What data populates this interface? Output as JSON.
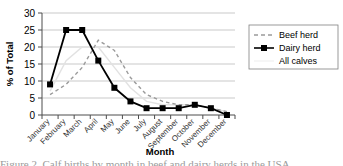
{
  "chart_data": {
    "type": "line",
    "title": "",
    "xlabel": "Month",
    "ylabel": "% of Total",
    "ylim": [
      0,
      30
    ],
    "yticks": [
      0,
      5,
      10,
      15,
      20,
      25,
      30
    ],
    "grid": true,
    "legend_position": "right",
    "categories": [
      "January",
      "February",
      "March",
      "April",
      "May",
      "June",
      "July",
      "August",
      "September",
      "October",
      "November",
      "December"
    ],
    "series": [
      {
        "name": "Beef herd",
        "style": "dashed",
        "color": "#9a9a9a",
        "marker": "none",
        "values": [
          6,
          9,
          14,
          22,
          19,
          11,
          6,
          4,
          3,
          3,
          2,
          1
        ]
      },
      {
        "name": "Dairy herd",
        "style": "solid",
        "color": "#000000",
        "marker": "square",
        "values": [
          9,
          25,
          25,
          16,
          8,
          4,
          2,
          2,
          2,
          3,
          2,
          0
        ]
      },
      {
        "name": "All calves",
        "style": "solid",
        "color": "#e2e2e2",
        "marker": "none",
        "values": [
          7,
          16,
          20,
          20,
          14,
          8,
          4,
          3,
          3,
          3,
          2,
          1
        ]
      }
    ]
  },
  "legend": {
    "items": [
      {
        "label": "Beef herd"
      },
      {
        "label": "Dairy herd"
      },
      {
        "label": "All calves"
      }
    ]
  },
  "axes": {
    "ylabel": "% of Total",
    "xlabel": "Month",
    "ytick_labels": [
      "30",
      "25",
      "20",
      "15",
      "10",
      "5",
      "0"
    ],
    "xtick_labels": [
      "January",
      "February",
      "March",
      "April",
      "May",
      "June",
      "July",
      "August",
      "September",
      "October",
      "November",
      "December"
    ]
  },
  "caption": {
    "text": "Figure 2. Calf births by month in beef and dairy herds in the USA"
  }
}
